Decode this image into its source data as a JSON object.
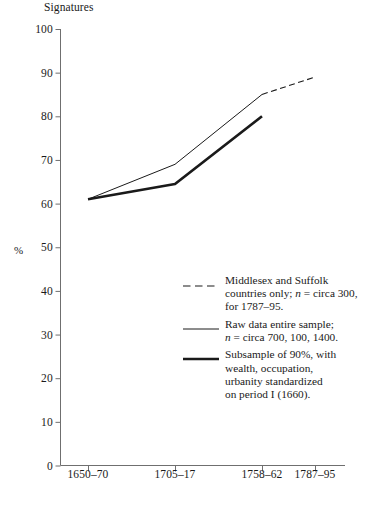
{
  "chart_data": {
    "type": "line",
    "title": "Signatures",
    "xlabel": "",
    "ylabel": "%",
    "categories": [
      "1650–70",
      "1705–17",
      "1758–62",
      "1787–95"
    ],
    "ylim": [
      0,
      100
    ],
    "yticks": [
      0,
      10,
      20,
      30,
      40,
      50,
      60,
      70,
      80,
      90,
      100
    ],
    "ytick_labels": [
      "0",
      "10",
      "20",
      "30",
      "40",
      "50",
      "60",
      "70",
      "80",
      "90",
      "100"
    ],
    "grid": false,
    "legend_position": "center-right inside axes",
    "series": [
      {
        "name": "Middlesex and Suffolk countries only; n = circa 300, for 1787–95.",
        "style": "dashed",
        "x": [
          "1758–62",
          "1787–95"
        ],
        "values": [
          85,
          89
        ]
      },
      {
        "name": "Raw data entire sample; n = circa 700, 100, 1400.",
        "style": "thin-solid",
        "x": [
          "1650–70",
          "1705–17",
          "1758–62"
        ],
        "values": [
          61,
          69,
          85
        ]
      },
      {
        "name": "Subsample of 90%, with wealth, occupation, urbanity standardized on period I (1660).",
        "style": "thick-solid",
        "x": [
          "1650–70",
          "1705–17",
          "1758–62"
        ],
        "values": [
          61,
          64.5,
          80
        ]
      }
    ]
  },
  "legend": {
    "items": [
      {
        "swatch": "dashed",
        "line1": "Middlesex and Suffolk",
        "line2_a": "countries only; ",
        "line2_n": "n",
        "line2_b": " = circa 300,",
        "line3": "for 1787–95."
      },
      {
        "swatch": "thin-solid",
        "line1": "Raw data entire sample;",
        "line2_n": "n",
        "line2_b": " = circa 700, 100, 1400."
      },
      {
        "swatch": "thick-solid",
        "line1": "Subsample of 90%, with",
        "line2": "wealth, occupation,",
        "line3": "urbanity standardized",
        "line4": "on period I (1660)."
      }
    ]
  },
  "colors": {
    "axis": "#6f6f6f",
    "ink": "#1a1a1a",
    "background": "#ffffff"
  }
}
